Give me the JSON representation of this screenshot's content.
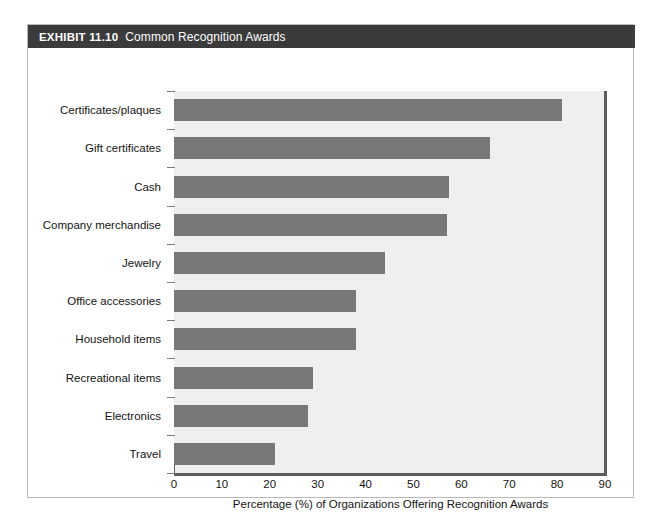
{
  "exhibit": {
    "number_label": "EXHIBIT 11.10",
    "title": "Common Recognition Awards"
  },
  "colors": {
    "header_bg": "#3b3b3b",
    "header_text": "#ffffff",
    "bar": "#787878",
    "plot_bg": "#efefef",
    "axis": "#5e5e5e",
    "frame_border": "#b9b9b9"
  },
  "chart_data": {
    "type": "bar",
    "orientation": "horizontal",
    "title": "Common Recognition Awards",
    "categories": [
      "Certificates/plaques",
      "Gift certificates",
      "Cash",
      "Company merchandise",
      "Jewelry",
      "Office accessories",
      "Household items",
      "Recreational items",
      "Electronics",
      "Travel"
    ],
    "values": [
      81,
      66,
      57.5,
      57,
      44,
      38,
      38,
      29,
      28,
      21
    ],
    "xlabel": "Percentage (%) of Organizations Offering Recognition Awards",
    "ylabel": "",
    "xlim": [
      0,
      90
    ],
    "xticks": [
      0,
      10,
      20,
      30,
      40,
      50,
      60,
      70,
      80,
      90
    ],
    "xtick_labels": [
      "0",
      "10",
      "20",
      "30",
      "40",
      "50",
      "60",
      "70",
      "80",
      "90"
    ],
    "grid": false,
    "legend": null
  }
}
